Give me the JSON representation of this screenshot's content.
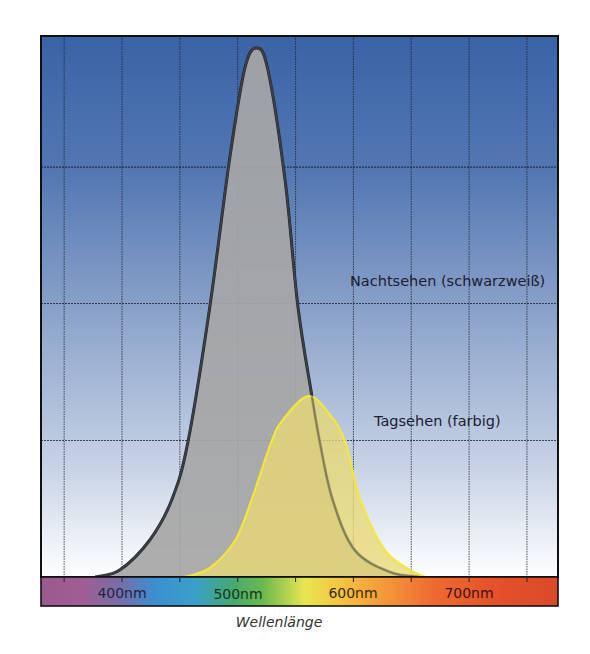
{
  "chart_data": {
    "type": "area",
    "title": "",
    "xlabel": "Wellenlänge",
    "ylabel": "",
    "x_unit": "nm",
    "xlim": [
      330,
      777
    ],
    "ylim": [
      0,
      1.0
    ],
    "grid": true,
    "legend_position": "inline labels (right)",
    "x_tick_labels": [
      {
        "value": 400,
        "label": "400nm"
      },
      {
        "value": 500,
        "label": "500nm"
      },
      {
        "value": 600,
        "label": "600nm"
      },
      {
        "value": 700,
        "label": "700nm"
      }
    ],
    "x_gridlines": [
      350,
      400,
      450,
      500,
      550,
      600,
      650,
      700,
      750
    ],
    "y_gridlines": [
      0.258,
      0.517,
      0.775
    ],
    "series": [
      {
        "name": "Nachtsehen (schwarzweiß)",
        "color": "#1e2430",
        "fill": "#a6a6a6",
        "peak_nm": 516,
        "peak_value": 1.0,
        "x": [
          377,
          398,
          424,
          443,
          457,
          476,
          493,
          506,
          516,
          526,
          541,
          552,
          564,
          571,
          582,
          601,
          632,
          658
        ],
        "values": [
          0.0,
          0.013,
          0.07,
          0.146,
          0.255,
          0.512,
          0.79,
          0.96,
          1.0,
          0.96,
          0.75,
          0.512,
          0.344,
          0.255,
          0.146,
          0.051,
          0.009,
          0.0
        ]
      },
      {
        "name": "Tagsehen (farbig)",
        "color": "#f2e640",
        "fill": "#e8d873",
        "peak_nm": 561,
        "peak_value": 0.342,
        "x": [
          454,
          476,
          498,
          512,
          529,
          539,
          561,
          580,
          593,
          606,
          627,
          649,
          662
        ],
        "values": [
          0.0,
          0.017,
          0.07,
          0.146,
          0.255,
          0.297,
          0.342,
          0.306,
          0.255,
          0.146,
          0.051,
          0.013,
          0.0
        ]
      }
    ],
    "annotations": [
      {
        "text": "Nachtsehen (schwarzweiß)",
        "series": 0
      },
      {
        "text": "Tagsehen (farbig)",
        "series": 1
      }
    ]
  },
  "labels": {
    "night": "Nachtsehen (schwarzweiß)",
    "day": "Tagsehen (farbig)",
    "tick_400": "400nm",
    "tick_500": "500nm",
    "tick_600": "600nm",
    "tick_700": "700nm",
    "xlabel": "Wellenlänge"
  },
  "colors": {
    "background_top": "#3a64a6",
    "background_mid": "#8ea6cc",
    "background_bottom": "#ffffff",
    "grid": "#1a1f2a",
    "frame": "#111111",
    "text": "#1b2030"
  }
}
